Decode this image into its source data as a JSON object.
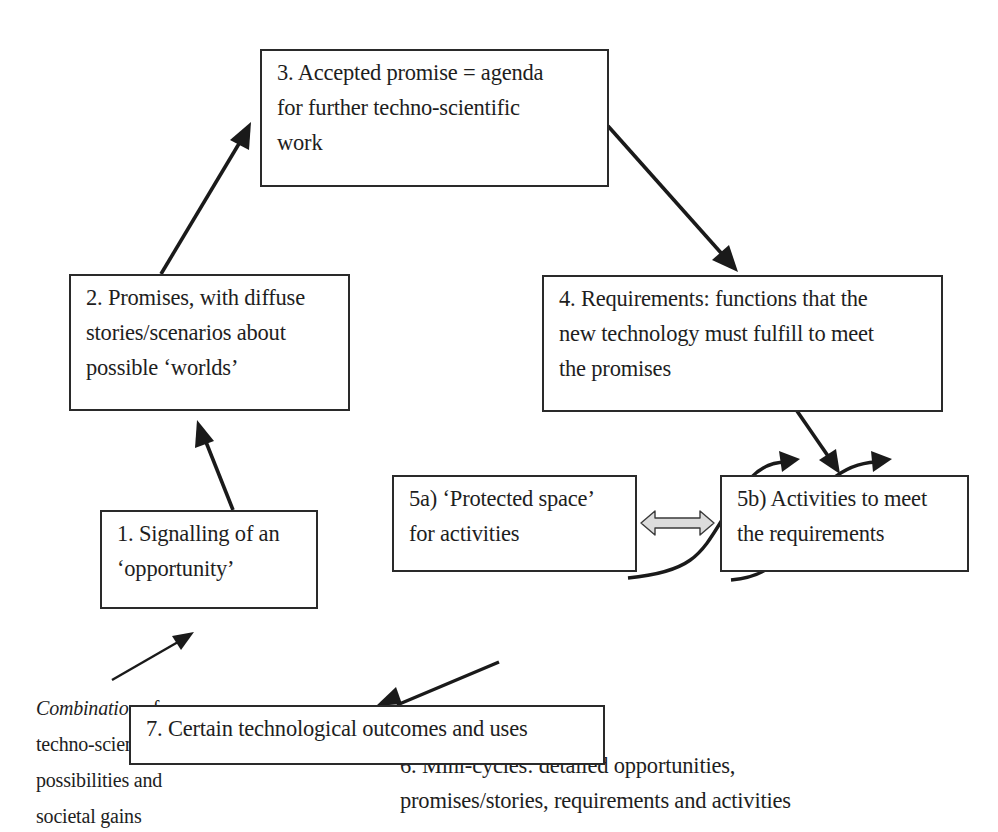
{
  "diagram": {
    "type": "process-cycle",
    "colors": {
      "line": "#1a1a1a",
      "box_border": "#2a2a2a",
      "text": "#1e1e1e",
      "double_arrow_fill": "#dcdcdc",
      "background": "#ffffff"
    },
    "nodes": {
      "step1": {
        "id": "1",
        "lines": [
          "1. Signalling of an",
          "‘opportunity’"
        ]
      },
      "step2": {
        "id": "2",
        "lines": [
          "2. Promises, with diffuse",
          "stories/scenarios about",
          "possible ‘worlds’"
        ]
      },
      "step3": {
        "id": "3",
        "lines": [
          "3. Accepted promise = agenda",
          "for further techno-scientific",
          "work"
        ]
      },
      "step4": {
        "id": "4",
        "lines": [
          "4. Requirements: functions that the",
          "new technology must fulfill to meet",
          "the promises"
        ]
      },
      "step5a": {
        "id": "5a",
        "lines": [
          "5a) ‘Protected space’",
          "for activities"
        ]
      },
      "step5b": {
        "id": "5b",
        "lines": [
          "5b) Activities to meet",
          "the requirements"
        ]
      },
      "step6": {
        "id": "6",
        "lines": [
          "6. Mini-cycles: detailed opportunities,",
          "promises/stories, requirements and activities"
        ]
      },
      "step7": {
        "id": "7",
        "lines": [
          "7. Certain technological outcomes and uses"
        ]
      }
    },
    "input_annotation": {
      "italic_word": "Combination",
      "rest_first_line": " of",
      "lines": [
        "techno-scientific",
        "possibilities and",
        "societal gains"
      ]
    },
    "edges": [
      {
        "from": "input_annotation",
        "to": "step1",
        "style": "thin-arrow"
      },
      {
        "from": "step1",
        "to": "step2",
        "style": "arrow"
      },
      {
        "from": "step2",
        "to": "step3",
        "style": "arrow"
      },
      {
        "from": "step3",
        "to": "step4",
        "style": "arrow"
      },
      {
        "from": "step4",
        "to": "step5b",
        "style": "arrow"
      },
      {
        "from": "step5a",
        "to": "step5b",
        "style": "double-hollow-arrow"
      },
      {
        "from": "step6",
        "to": "step5b",
        "style": "s-curve-arrow",
        "count": 2
      },
      {
        "from": "step6",
        "to": "step7",
        "style": "arrow"
      }
    ]
  }
}
